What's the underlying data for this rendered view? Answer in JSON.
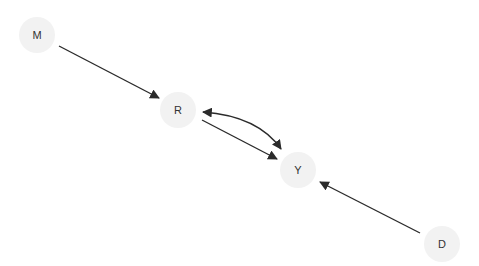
{
  "diagram": {
    "type": "directed-acyclic-graph",
    "node_fill": "#f2f2f2",
    "edge_color": "#2b2b2b",
    "label_color": "#333333",
    "nodes": [
      {
        "id": "M",
        "label": "M",
        "x": 37,
        "y": 35
      },
      {
        "id": "R",
        "label": "R",
        "x": 178,
        "y": 110
      },
      {
        "id": "Y",
        "label": "Y",
        "x": 298,
        "y": 170
      },
      {
        "id": "D",
        "label": "D",
        "x": 442,
        "y": 244
      }
    ],
    "edges": [
      {
        "from": "M",
        "to": "R",
        "style": "directed"
      },
      {
        "from": "R",
        "to": "Y",
        "style": "directed"
      },
      {
        "from": "R",
        "to": "Y",
        "style": "bidirected-curved"
      },
      {
        "from": "D",
        "to": "Y",
        "style": "directed"
      }
    ]
  }
}
